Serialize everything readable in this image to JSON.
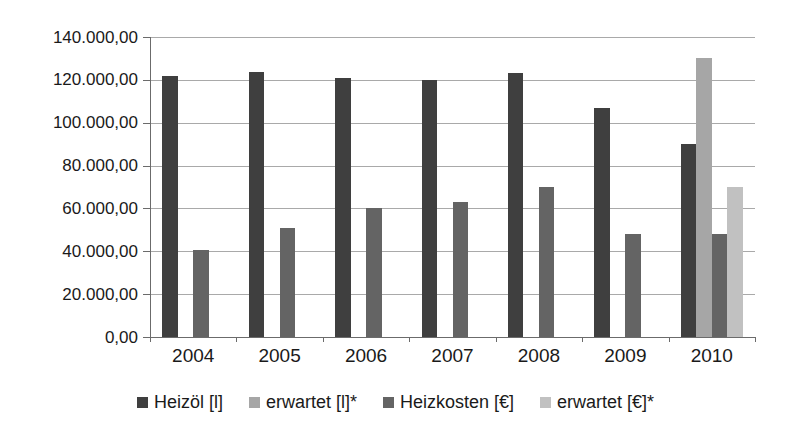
{
  "figure": {
    "background": "#ffffff",
    "text_color": "#1a1a1a",
    "grid_color": "#a9a9a9",
    "axis_color": "#6b6b6b"
  },
  "chart_data": {
    "type": "bar",
    "title": "",
    "xlabel": "",
    "ylabel": "",
    "grid": true,
    "legend_position": "bottom",
    "categories": [
      "2004",
      "2005",
      "2006",
      "2007",
      "2008",
      "2009",
      "2010"
    ],
    "series": [
      {
        "name": "Heizöl [l]",
        "slug": "heizol-l",
        "color": "#3f3f3f",
        "values": [
          122000,
          123500,
          121000,
          120000,
          123000,
          107000,
          90000
        ]
      },
      {
        "name": "erwartet [l]*",
        "slug": "erwartet-l",
        "color": "#a6a6a6",
        "values": [
          null,
          null,
          null,
          null,
          null,
          null,
          130000
        ]
      },
      {
        "name": "Heizkosten [€]",
        "slug": "heizkosten-eur",
        "color": "#646464",
        "values": [
          40500,
          51000,
          60000,
          63000,
          70000,
          48000,
          48000
        ]
      },
      {
        "name": "erwartet [€]*",
        "slug": "erwartet-eur",
        "color": "#c1c1c1",
        "values": [
          null,
          null,
          null,
          null,
          null,
          null,
          70000
        ]
      }
    ],
    "ylim": [
      0,
      140000
    ],
    "ytick_step": 20000,
    "ytick_labels": [
      "0,00",
      "20.000,00",
      "40.000,00",
      "60.000,00",
      "80.000,00",
      "100.000,00",
      "120.000,00",
      "140.000,00"
    ]
  }
}
